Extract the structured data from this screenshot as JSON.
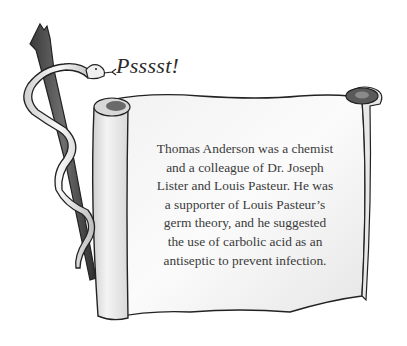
{
  "illustration": {
    "speech_text": "Psssst!",
    "scroll_text_lines": [
      "Thomas Anderson was a chemist",
      "and a colleague of Dr. Joseph",
      "Lister and Louis Pasteur. He was",
      "a supporter of Louis Pasteur’s",
      "germ theory, and he suggested",
      "the use of carbolic acid as an",
      "antiseptic to prevent infection."
    ],
    "elements": [
      "snake-icon",
      "staff-icon",
      "parchment-scroll"
    ],
    "colors": {
      "background": "#ffffff",
      "ink": "#2b2b2b",
      "parchment": "#f7f7f5",
      "shadow": "#9a9a9a",
      "staff": "#4a4a4a"
    }
  }
}
